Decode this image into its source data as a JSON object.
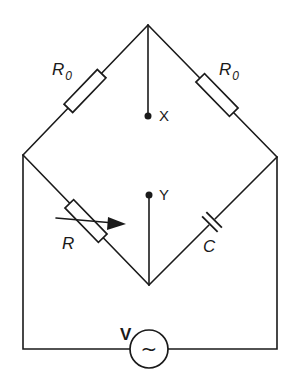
{
  "diagram": {
    "type": "AC bridge circuit",
    "components": {
      "r0_left": {
        "symbol": "R",
        "subscript": "0"
      },
      "r0_right": {
        "symbol": "R",
        "subscript": "0"
      },
      "r_variable": {
        "symbol": "R"
      },
      "capacitor": {
        "symbol": "C"
      },
      "source": {
        "symbol": "V",
        "glyph": "~"
      }
    },
    "terminals": {
      "x": "X",
      "y": "Y"
    },
    "colors": {
      "ink": "#1a1a1a",
      "background": "#ffffff"
    }
  }
}
